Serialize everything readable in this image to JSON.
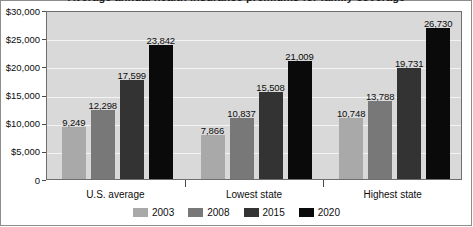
{
  "chart_data": {
    "type": "bar",
    "title": "Average annual health insurance premiums for family coverage",
    "xlabel": "",
    "ylabel": "",
    "ylim": [
      0,
      30000
    ],
    "ytick_labels": [
      "$30,000",
      "$25,000",
      "$20,000",
      "$15,000",
      "$10,000",
      "$5,000",
      "0"
    ],
    "ytick_values": [
      30000,
      25000,
      20000,
      15000,
      10000,
      5000,
      0
    ],
    "grid": true,
    "legend_position": "bottom",
    "categories": [
      "U.S. average",
      "Lowest state",
      "Highest state"
    ],
    "series": [
      {
        "name": "2003",
        "color": "#a9a9a9",
        "values": [
          9249,
          7866,
          10748
        ],
        "labels": [
          "9,249",
          "7,866",
          "10,748"
        ]
      },
      {
        "name": "2008",
        "color": "#787878",
        "values": [
          12298,
          10837,
          13788
        ],
        "labels": [
          "12,298",
          "10,837",
          "13,788"
        ]
      },
      {
        "name": "2015",
        "color": "#333333",
        "values": [
          17599,
          15508,
          19731
        ],
        "labels": [
          "17,599",
          "15,508",
          "19,731"
        ]
      },
      {
        "name": "2020",
        "color": "#0a0a0a",
        "values": [
          23842,
          21009,
          26730
        ],
        "labels": [
          "23,842",
          "21,009",
          "26,730"
        ]
      }
    ]
  },
  "style": {
    "plot_background": "#d9d9d9",
    "gridline_color": "#f4f4f4",
    "axis_color": "#6e6e6e",
    "text_color": "#0d0d0d"
  }
}
